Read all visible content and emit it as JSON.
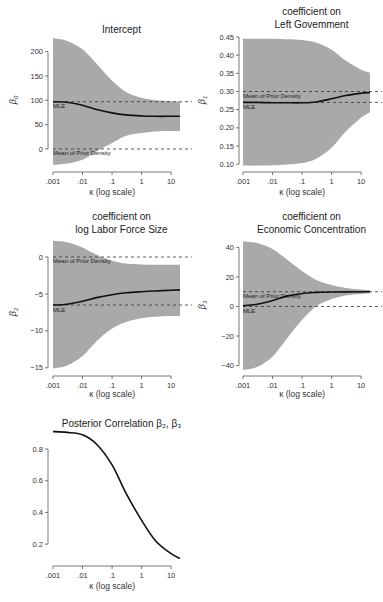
{
  "chart_data": [
    {
      "type": "area",
      "id": "intercept",
      "title": "Intercept",
      "title_lines": [
        "Intercept"
      ],
      "xlabel": "κ (log scale)",
      "ylabel": "β0",
      "x_scale": "log",
      "x_ticks": [
        0.001,
        0.01,
        0.1,
        1,
        10
      ],
      "x_tick_labels": [
        ".001",
        ".01",
        ".1",
        "1",
        "10"
      ],
      "xlim": [
        0.001,
        20
      ],
      "y_ticks": [
        0,
        50,
        100,
        150,
        200
      ],
      "y_tick_labels": [
        "0",
        "50",
        "100",
        "150",
        "200"
      ],
      "ylim": [
        -35,
        230
      ],
      "reference_lines": [
        {
          "label": "MLE",
          "y": 97
        },
        {
          "label": "Mean of Prior Density",
          "y": 0
        }
      ],
      "x": [
        0.001,
        0.003,
        0.01,
        0.03,
        0.1,
        0.3,
        1,
        3,
        10,
        20
      ],
      "series": [
        {
          "name": "posterior mean",
          "values": [
            97,
            96,
            90,
            81,
            74,
            70,
            68,
            67,
            67,
            67
          ]
        },
        {
          "name": "upper band",
          "values": [
            228,
            222,
            205,
            175,
            140,
            117,
            105,
            100,
            98,
            97
          ]
        },
        {
          "name": "lower band",
          "values": [
            -33,
            -30,
            -22,
            -5,
            12,
            27,
            33,
            36,
            37,
            37
          ]
        }
      ]
    },
    {
      "type": "area",
      "id": "left-government",
      "title": "coefficient on Left Government",
      "title_lines": [
        "coefficient on",
        "Left Govemment"
      ],
      "xlabel": "κ (log scale)",
      "ylabel": "β1",
      "x_scale": "log",
      "x_ticks": [
        0.001,
        0.01,
        0.1,
        1,
        10
      ],
      "x_tick_labels": [
        ".001",
        ".01",
        ".1",
        "1",
        "10"
      ],
      "xlim": [
        0.001,
        20
      ],
      "y_ticks": [
        0.1,
        0.15,
        0.2,
        0.25,
        0.3,
        0.35,
        0.4,
        0.45
      ],
      "y_tick_labels": [
        "0.10",
        "0.15",
        "0.20",
        "0.25",
        "0.30",
        "0.35",
        "0.40",
        "0.45"
      ],
      "ylim": [
        0.095,
        0.45
      ],
      "reference_lines": [
        {
          "label": "Mean of Prior Density",
          "y": 0.3
        },
        {
          "label": "MLE",
          "y": 0.27
        }
      ],
      "x": [
        0.001,
        0.003,
        0.01,
        0.03,
        0.1,
        0.3,
        1,
        3,
        10,
        20
      ],
      "series": [
        {
          "name": "posterior mean",
          "values": [
            0.27,
            0.27,
            0.269,
            0.269,
            0.269,
            0.271,
            0.28,
            0.289,
            0.295,
            0.297
          ]
        },
        {
          "name": "upper band",
          "values": [
            0.445,
            0.445,
            0.445,
            0.444,
            0.442,
            0.435,
            0.415,
            0.385,
            0.36,
            0.352
          ]
        },
        {
          "name": "lower band",
          "values": [
            0.096,
            0.096,
            0.097,
            0.099,
            0.103,
            0.115,
            0.145,
            0.19,
            0.228,
            0.243
          ]
        }
      ]
    },
    {
      "type": "area",
      "id": "labor-force",
      "title": "coefficient on log Labor Force Size",
      "title_lines": [
        "coefficient on",
        "log Labor Force Size"
      ],
      "xlabel": "κ (log scale)",
      "ylabel": "β2",
      "x_scale": "log",
      "x_ticks": [
        0.001,
        0.01,
        0.1,
        1,
        10
      ],
      "x_tick_labels": [
        ".001",
        ".01",
        ".1",
        "1",
        "10"
      ],
      "xlim": [
        0.001,
        20
      ],
      "y_ticks": [
        -15,
        -10,
        -5,
        0
      ],
      "y_tick_labels": [
        "−15",
        "−10",
        "−5",
        "0"
      ],
      "ylim": [
        -15.3,
        2.3
      ],
      "reference_lines": [
        {
          "label": "Mean of Prior Density",
          "y": 0
        },
        {
          "label": "MLE",
          "y": -6.5
        }
      ],
      "x": [
        0.001,
        0.003,
        0.01,
        0.03,
        0.1,
        0.3,
        1,
        3,
        10,
        20
      ],
      "series": [
        {
          "name": "posterior mean",
          "values": [
            -6.5,
            -6.4,
            -6.0,
            -5.5,
            -5.1,
            -4.85,
            -4.7,
            -4.6,
            -4.5,
            -4.45
          ]
        },
        {
          "name": "upper band",
          "values": [
            2.2,
            2.0,
            1.3,
            0.3,
            -0.5,
            -0.9,
            -1.0,
            -1.05,
            -1.05,
            -1.05
          ]
        },
        {
          "name": "lower band",
          "values": [
            -15.1,
            -14.7,
            -13.4,
            -11.4,
            -9.7,
            -8.8,
            -8.3,
            -8.1,
            -8.0,
            -8.0
          ]
        }
      ]
    },
    {
      "type": "area",
      "id": "economic-concentration",
      "title": "coefficient on Economic Concentration",
      "title_lines": [
        "coefficient on",
        "Economic Concentration"
      ],
      "xlabel": "κ (log scale)",
      "ylabel": "β3",
      "x_scale": "log",
      "x_ticks": [
        0.001,
        0.01,
        0.1,
        1,
        10
      ],
      "x_tick_labels": [
        ".001",
        ".01",
        ".1",
        "1",
        "10"
      ],
      "xlim": [
        0.001,
        20
      ],
      "y_ticks": [
        -40,
        -20,
        0,
        20,
        40
      ],
      "y_tick_labels": [
        "−40",
        "−20",
        "0",
        "20",
        "40"
      ],
      "ylim": [
        -43,
        45
      ],
      "reference_lines": [
        {
          "label": "Mean of Prior Density",
          "y": 10
        },
        {
          "label": "MLE",
          "y": 0
        }
      ],
      "x": [
        0.001,
        0.003,
        0.01,
        0.03,
        0.1,
        0.3,
        1,
        3,
        10,
        20
      ],
      "series": [
        {
          "name": "posterior mean",
          "values": [
            0.5,
            1.5,
            4,
            7,
            8.8,
            9.5,
            9.8,
            9.9,
            10,
            10
          ]
        },
        {
          "name": "upper band",
          "values": [
            44,
            43,
            39,
            32,
            24,
            18,
            14.5,
            12.5,
            11.5,
            11
          ]
        },
        {
          "name": "lower band",
          "values": [
            -43,
            -41,
            -34,
            -22,
            -9,
            0,
            5,
            7.5,
            8.5,
            9
          ]
        }
      ]
    },
    {
      "type": "line",
      "id": "posterior-correlation",
      "title": "Posterior Correlation β2, β3",
      "title_lines": [
        "Posterior Correlation β₂, β₃"
      ],
      "xlabel": "κ (log scale)",
      "ylabel": "",
      "x_scale": "log",
      "x_ticks": [
        0.001,
        0.01,
        0.1,
        1,
        10
      ],
      "x_tick_labels": [
        ".001",
        ".01",
        ".1",
        "1",
        "10"
      ],
      "xlim": [
        0.001,
        20
      ],
      "y_ticks": [
        0.2,
        0.4,
        0.6,
        0.8
      ],
      "y_tick_labels": [
        "0.2",
        "0.4",
        "0.6",
        "0.8"
      ],
      "ylim": [
        0.1,
        0.92
      ],
      "x": [
        0.001,
        0.003,
        0.01,
        0.03,
        0.1,
        0.3,
        1,
        3,
        10,
        20
      ],
      "series": [
        {
          "name": "correlation",
          "values": [
            0.91,
            0.905,
            0.89,
            0.83,
            0.7,
            0.52,
            0.35,
            0.22,
            0.14,
            0.11
          ]
        }
      ]
    }
  ]
}
